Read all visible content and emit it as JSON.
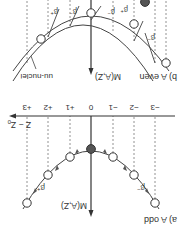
{
  "figure": {
    "orientation": "rotated 180 degrees",
    "panel_a": {
      "label": "a) A odd",
      "y_axis_label": "M(A,Z)",
      "x_axis_label": "Z − Z",
      "x_axis_subscript": "0",
      "tick_labels": [
        "−3",
        "−2",
        "−1",
        "0",
        "+1",
        "+2",
        "+3"
      ],
      "decay_left": "β",
      "decay_left_sup": "−",
      "decay_right": "β",
      "decay_right_sup": "+"
    },
    "panel_b": {
      "label": "b) A even",
      "y_axis_label": "M(A,Z)",
      "curve_upper_label": "uu-nuclei",
      "curve_lower_label": "gg-nuclei",
      "beta_minus": "β",
      "beta_minus_sup": "−",
      "beta_plus": "β",
      "beta_plus_sup": "+"
    },
    "colors": {
      "line": "#333333",
      "dashed": "#777777",
      "stable_fill": "#555555",
      "open_fill": "#ffffff"
    }
  }
}
